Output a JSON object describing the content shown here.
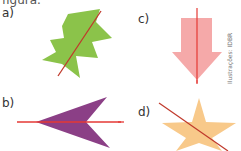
{
  "header": {
    "partial_text": "figura."
  },
  "figures": [
    {
      "label": "a)",
      "shape": "zigzag-leaf",
      "fill": "#8bc34a",
      "axis_color": "#c0392b"
    },
    {
      "label": "b)",
      "shape": "arrowhead",
      "fill": "#8b3f86",
      "axis_color": "#e53935"
    },
    {
      "label": "c)",
      "shape": "down-arrow",
      "fill": "#f4a4a4",
      "axis_color": "#e53935"
    },
    {
      "label": "d)",
      "shape": "star",
      "fill": "#f8c98a",
      "axis_color": "#c0392b"
    }
  ],
  "credit": "Ilustrações: IDBR"
}
